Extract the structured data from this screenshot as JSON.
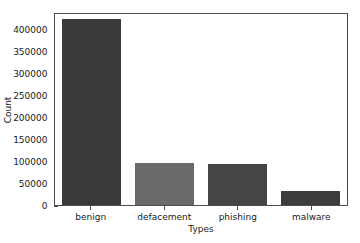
{
  "chart_data": {
    "type": "bar",
    "title": "",
    "xlabel": "Types",
    "ylabel": "Count",
    "categories": [
      "benign",
      "defacement",
      "phishing",
      "malware"
    ],
    "values": [
      428103,
      96457,
      94111,
      32520
    ],
    "ylim": [
      0,
      440000
    ],
    "yticks": [
      0,
      50000,
      100000,
      150000,
      200000,
      250000,
      300000,
      350000,
      400000
    ],
    "ytick_labels": [
      "0",
      "50000",
      "100000",
      "150000",
      "200000",
      "250000",
      "300000",
      "350000",
      "400000"
    ],
    "grid": false,
    "legend": null,
    "bar_colors": [
      "#3a3a3a",
      "#6a6a6a",
      "#454545",
      "#3d3d3d"
    ],
    "axis_color": "#4d4d4d",
    "background": "#ffffff"
  }
}
